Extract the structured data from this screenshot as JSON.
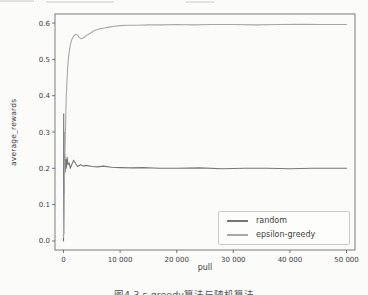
{
  "figure": {
    "caption_clipped": "图4.3 ε-greedy算法与随机算法",
    "xlabel": "pull",
    "ylabel": "average_rewards"
  },
  "chart_data": {
    "type": "line",
    "title": "",
    "xlabel": "pull",
    "ylabel": "average_rewards",
    "xlim": [
      -1500,
      51500
    ],
    "ylim": [
      -0.025,
      0.625
    ],
    "grid": false,
    "legend_position": "lower right",
    "frame": "all-four-spines",
    "xticks": [
      {
        "value": 0,
        "label": "0"
      },
      {
        "value": 10000,
        "label": "10 000"
      },
      {
        "value": 20000,
        "label": "20 000"
      },
      {
        "value": 30000,
        "label": "30 000"
      },
      {
        "value": 40000,
        "label": "40 000"
      },
      {
        "value": 50000,
        "label": "50 000"
      }
    ],
    "yticks": [
      {
        "value": 0.0,
        "label": "0.0"
      },
      {
        "value": 0.1,
        "label": "0.1"
      },
      {
        "value": 0.2,
        "label": "0.2"
      },
      {
        "value": 0.3,
        "label": "0.3"
      },
      {
        "value": 0.4,
        "label": "0.4"
      },
      {
        "value": 0.5,
        "label": "0.5"
      },
      {
        "value": 0.6,
        "label": "0.6"
      }
    ],
    "series": [
      {
        "name": "random",
        "color": "#767676",
        "x": [
          0,
          30,
          60,
          100,
          150,
          220,
          300,
          400,
          500,
          650,
          800,
          1000,
          1200,
          1500,
          1800,
          2100,
          2500,
          3000,
          3500,
          4000,
          5000,
          6000,
          7000,
          8500,
          10000,
          12000,
          14000,
          17000,
          20000,
          24000,
          28000,
          32000,
          36000,
          40000,
          44000,
          47000,
          50000
        ],
        "y": [
          0.0,
          0.35,
          0.02,
          0.3,
          0.13,
          0.24,
          0.19,
          0.225,
          0.2,
          0.23,
          0.21,
          0.215,
          0.2,
          0.212,
          0.222,
          0.214,
          0.205,
          0.21,
          0.206,
          0.208,
          0.205,
          0.204,
          0.206,
          0.203,
          0.202,
          0.201,
          0.202,
          0.2,
          0.2,
          0.201,
          0.199,
          0.2,
          0.2,
          0.199,
          0.2,
          0.2,
          0.2
        ]
      },
      {
        "name": "epsilon-greedy",
        "color": "#a8a8a8",
        "x": [
          0,
          60,
          150,
          250,
          350,
          450,
          550,
          700,
          850,
          1000,
          1200,
          1400,
          1600,
          1900,
          2200,
          2500,
          2800,
          3100,
          3500,
          3900,
          4400,
          5000,
          5600,
          6300,
          7000,
          8000,
          9000,
          10000,
          11500,
          13000,
          15000,
          17500,
          20000,
          23000,
          26000,
          30000,
          34000,
          38000,
          42000,
          46000,
          50000
        ],
        "y": [
          0.01,
          0.06,
          0.15,
          0.24,
          0.31,
          0.37,
          0.42,
          0.47,
          0.5,
          0.52,
          0.54,
          0.551,
          0.559,
          0.566,
          0.569,
          0.566,
          0.56,
          0.557,
          0.559,
          0.564,
          0.569,
          0.575,
          0.58,
          0.584,
          0.586,
          0.589,
          0.591,
          0.593,
          0.594,
          0.594,
          0.595,
          0.595,
          0.596,
          0.595,
          0.596,
          0.596,
          0.595,
          0.596,
          0.597,
          0.596,
          0.596
        ]
      }
    ]
  }
}
